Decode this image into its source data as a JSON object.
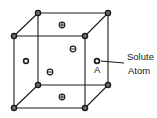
{
  "diagram": {
    "title": "",
    "labels": {
      "solute_line1": "Solute",
      "solute_line2": "Atom",
      "site_label": "A"
    },
    "corners": [
      {
        "id": "back-top-left",
        "x": 38,
        "y": 13
      },
      {
        "id": "back-top-right",
        "x": 108,
        "y": 13
      },
      {
        "id": "front-top-left",
        "x": 14,
        "y": 36
      },
      {
        "id": "front-top-right",
        "x": 85,
        "y": 36
      },
      {
        "id": "back-bottom-left",
        "x": 38,
        "y": 85
      },
      {
        "id": "back-bottom-right",
        "x": 108,
        "y": 85
      },
      {
        "id": "front-bottom-left",
        "x": 14,
        "y": 108
      },
      {
        "id": "front-bottom-right",
        "x": 85,
        "y": 108
      }
    ],
    "face_atoms": [
      {
        "face": "top",
        "symbol": "plus",
        "x": 62,
        "y": 25
      },
      {
        "face": "back",
        "symbol": "minus",
        "x": 73,
        "y": 49
      },
      {
        "face": "left",
        "symbol": "empty",
        "x": 26,
        "y": 61
      },
      {
        "face": "front",
        "symbol": "minus",
        "x": 50,
        "y": 72
      },
      {
        "face": "bottom",
        "symbol": "plus",
        "x": 62,
        "y": 97
      },
      {
        "face": "right",
        "symbol": "solute",
        "x": 97,
        "y": 61
      }
    ],
    "colors": {
      "line": "#1a1a1a",
      "corner_fill": "#6a6a6a",
      "background": "#ffffff"
    }
  }
}
